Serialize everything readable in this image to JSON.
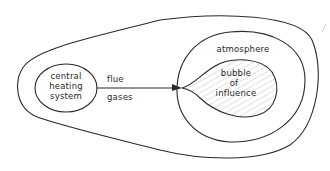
{
  "diagram": {
    "source_node": {
      "label_lines": [
        "central",
        "heating",
        "system"
      ]
    },
    "edge": {
      "label_lines": [
        "flue",
        "gases"
      ],
      "direction": "source-to-bubble"
    },
    "outer_environment": {
      "label": ""
    },
    "atmosphere": {
      "label": "atmosphere"
    },
    "bubble": {
      "label_lines": [
        "bubble",
        "of",
        "influence"
      ],
      "fill_pattern": "diagonal-hatch"
    },
    "colors": {
      "ink": "#2a2a2a",
      "hatch": "#9a9a9a",
      "background": "#ffffff"
    }
  }
}
